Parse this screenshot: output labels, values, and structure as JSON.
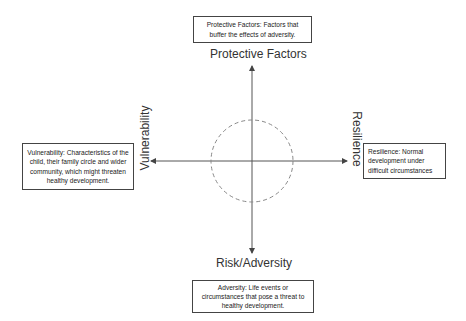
{
  "diagram": {
    "axes": {
      "top": "Protective Factors",
      "bottom": "Risk/Adversity",
      "left": "Vulnerability",
      "right": "Resilience"
    },
    "boxes": {
      "top": "Protective Factors: Factors that buffer the effects of adversity.",
      "left": "Vulnerability: Characteristics of the child, their family circle and wider community, which might threaten healthy development.",
      "right": "Resilience: Normal development under difficult circumstances",
      "bottom": "Adversity: Life events or circumstances that pose a threat to healthy development."
    },
    "colors": {
      "axis": "#555555",
      "circle": "#888888",
      "box_border": "#444444"
    }
  }
}
